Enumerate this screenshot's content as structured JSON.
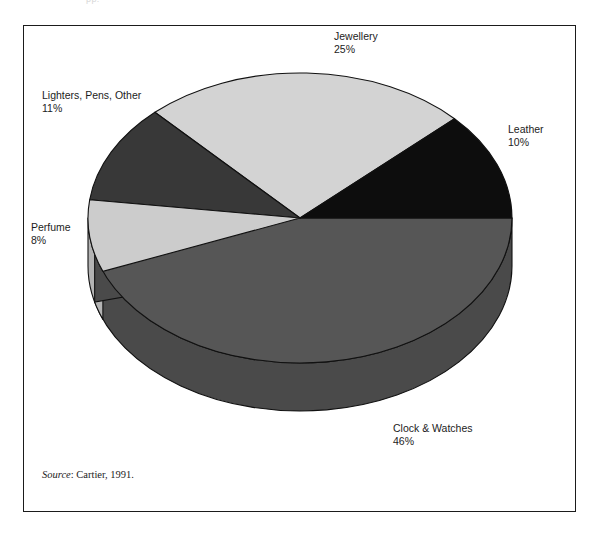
{
  "figure": {
    "top_artifact_text": "pp.",
    "frame_color": "#1b1b1b",
    "background_color": "#ffffff"
  },
  "source": {
    "label": "Source",
    "separator": ": ",
    "text": "Cartier, 1991."
  },
  "chart_data": {
    "type": "pie",
    "title": "",
    "subtitle": "",
    "xlabel": "",
    "ylabel": "",
    "legend_position": "none",
    "grid": false,
    "style": "3d-extruded-pie",
    "units": "percent",
    "total": 100,
    "categories": [
      "Clock & Watches",
      "Jewellery",
      "Lighters, Pens, Other",
      "Perfume",
      "Leather"
    ],
    "values": [
      46,
      25,
      11,
      8,
      10
    ],
    "slices": [
      {
        "name": "Clock & Watches",
        "value": 46,
        "value_label": "46%",
        "color": "#565656",
        "side_color": "#4a4a4a",
        "start_angle_deg": 0,
        "end_angle_deg": 165.6,
        "label_position": "bottom"
      },
      {
        "name": "Jewellery",
        "value": 25,
        "value_label": "25%",
        "color": "#d3d3d3",
        "side_color": "#b9b9b9",
        "start_angle_deg": 226.8,
        "end_angle_deg": 316.8,
        "label_position": "top"
      },
      {
        "name": "Lighters, Pens, Other",
        "value": 11,
        "value_label": "11%",
        "color": "#383838",
        "side_color": "#2e2e2e",
        "start_angle_deg": 187.2,
        "end_angle_deg": 226.8,
        "label_position": "upper-left"
      },
      {
        "name": "Perfume",
        "value": 8,
        "value_label": "8%",
        "color": "#cccccc",
        "side_color": "#b3b3b3",
        "start_angle_deg": 158.4,
        "end_angle_deg": 187.2,
        "label_position": "left"
      },
      {
        "name": "Leather",
        "value": 10,
        "value_label": "10%",
        "color": "#0d0d0d",
        "side_color": "#0a0a0a",
        "start_angle_deg": 316.8,
        "end_angle_deg": 360,
        "label_position": "right"
      }
    ],
    "annotations": [
      {
        "text": "Jewellery",
        "value": "25%"
      },
      {
        "text": "Leather",
        "value": "10%"
      },
      {
        "text": "Clock & Watches",
        "value": "46%"
      },
      {
        "text": "Perfume",
        "value": "8%"
      },
      {
        "text": "Lighters, Pens, Other",
        "value": "11%"
      }
    ]
  }
}
